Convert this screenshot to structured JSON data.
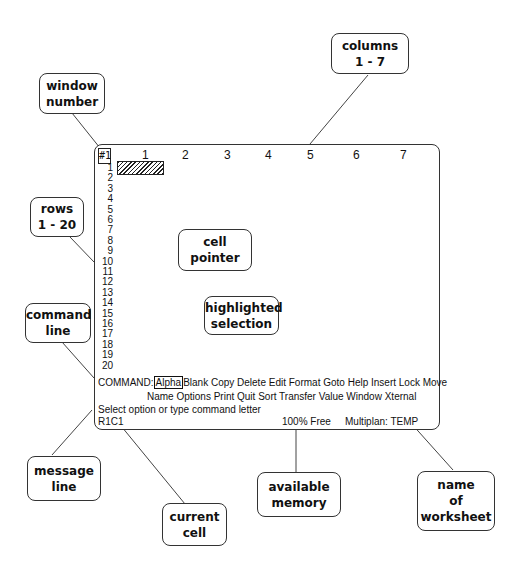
{
  "window": {
    "number": "#1",
    "columns": [
      "1",
      "2",
      "3",
      "4",
      "5",
      "6",
      "7"
    ],
    "rows": [
      "1",
      "2",
      "3",
      "4",
      "5",
      "6",
      "7",
      "8",
      "9",
      "10",
      "11",
      "12",
      "13",
      "14",
      "15",
      "16",
      "17",
      "18",
      "19",
      "20"
    ],
    "command_prefix": "COMMAND:",
    "highlighted_command": "Alpha",
    "commands_line1": "Blank Copy Delete Edit Format Goto Help Insert Lock Move",
    "commands_line2": "Name Options Print Quit Sort Transfer Value Window Xternal",
    "message": "Select option or type command letter",
    "current_cell": "R1C1",
    "free_memory": "100% Free",
    "worksheet_name": "Multiplan: TEMP"
  },
  "callouts": {
    "columns": [
      "columns",
      "1 - 7"
    ],
    "window_number": [
      "window",
      "number"
    ],
    "rows": [
      "rows",
      "1 - 20"
    ],
    "cell_pointer": [
      "cell",
      "pointer"
    ],
    "command_line": [
      "command",
      "line"
    ],
    "highlighted_selection": [
      "highlighted",
      "selection"
    ],
    "message_line": [
      "message",
      "line"
    ],
    "current_cell": [
      "current",
      "cell"
    ],
    "available_memory": [
      "available",
      "memory"
    ],
    "worksheet_name": [
      "name",
      "of",
      "worksheet"
    ]
  }
}
